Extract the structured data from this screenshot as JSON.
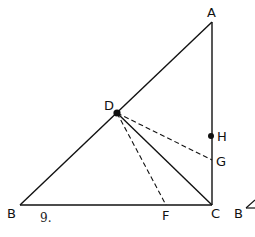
{
  "figure": {
    "number_label": "9.",
    "stroke_color": "#111111",
    "background": "#ffffff"
  },
  "points": {
    "A": {
      "label": "A",
      "x": 212,
      "y": 22
    },
    "B": {
      "label": "B",
      "x": 20,
      "y": 205
    },
    "C": {
      "label": "C",
      "x": 212,
      "y": 205
    },
    "D": {
      "label": "D",
      "x": 117,
      "y": 113
    },
    "F": {
      "label": "F",
      "x": 166,
      "y": 205
    },
    "G": {
      "label": "G",
      "x": 212,
      "y": 160
    },
    "H": {
      "label": "H",
      "x": 212,
      "y": 136
    }
  },
  "segments": {
    "solid": [
      "AB",
      "AC",
      "BC",
      "DC"
    ],
    "dashed": [
      "DF",
      "DG"
    ]
  },
  "marked_points": [
    "D",
    "H"
  ],
  "cropped_next_figure": {
    "label": "B"
  }
}
